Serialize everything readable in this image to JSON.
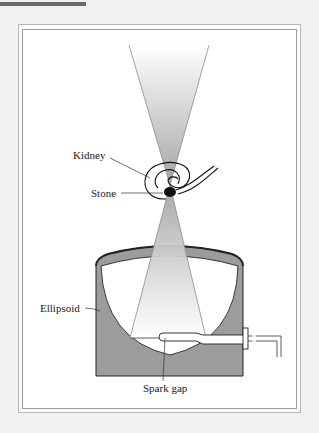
{
  "figure": {
    "type": "diagram",
    "labels": {
      "kidney": "Kidney",
      "stone": "Stone",
      "ellipsoid": "Ellipsoid",
      "spark_gap": "Spark gap"
    },
    "colors": {
      "ellipsoid_fill": "#9a9a9a",
      "beam_gray": "#a8a8a8",
      "stone": "#111111",
      "outline": "#222222",
      "frame": "#9a9a9a"
    }
  }
}
